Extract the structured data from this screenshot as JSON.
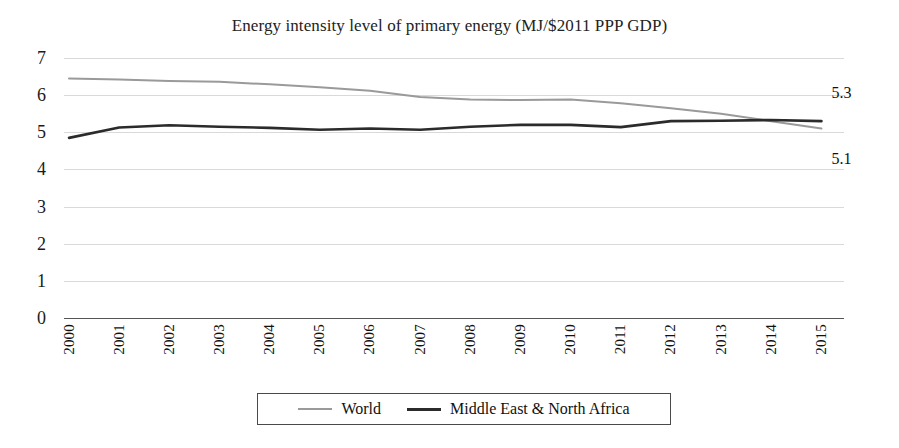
{
  "chart_data": {
    "type": "line",
    "title": "Energy intensity level of primary energy (MJ/$2011 PPP GDP)",
    "xlabel": "",
    "ylabel": "",
    "grid": true,
    "legend_position": "bottom",
    "ylim": [
      0,
      7
    ],
    "yticks": [
      "0",
      "1",
      "2",
      "3",
      "4",
      "5",
      "6",
      "7"
    ],
    "categories": [
      "2000",
      "2001",
      "2002",
      "2003",
      "2004",
      "2005",
      "2006",
      "2007",
      "2008",
      "2009",
      "2010",
      "2011",
      "2012",
      "2013",
      "2014",
      "2015"
    ],
    "series": [
      {
        "name": "World",
        "color": "#9a9a9a",
        "width": 2,
        "values": [
          6.45,
          6.42,
          6.38,
          6.36,
          6.29,
          6.21,
          6.12,
          5.95,
          5.88,
          5.87,
          5.88,
          5.78,
          5.65,
          5.5,
          5.3,
          5.1
        ],
        "end_label": "5.1"
      },
      {
        "name": "Middle East & North Africa",
        "color": "#2b2b2b",
        "width": 2.6,
        "values": [
          4.85,
          5.13,
          5.19,
          5.15,
          5.12,
          5.07,
          5.1,
          5.07,
          5.15,
          5.2,
          5.2,
          5.14,
          5.3,
          5.31,
          5.33,
          5.3
        ],
        "end_label": "5.3"
      }
    ],
    "annotations": [
      {
        "name": "mena-end-value",
        "text": "5.3",
        "value": 5.3
      },
      {
        "name": "world-end-value",
        "text": "5.1",
        "value": 5.1
      }
    ]
  },
  "legend": {
    "items": [
      {
        "label": "World",
        "color": "#9a9a9a",
        "width": 2
      },
      {
        "label": "Middle East & North Africa",
        "color": "#2b2b2b",
        "width": 3
      }
    ]
  }
}
